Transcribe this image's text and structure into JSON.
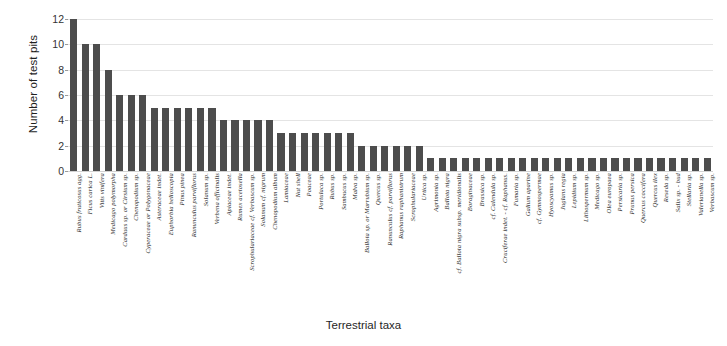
{
  "chart_data": {
    "type": "bar",
    "title": "",
    "xlabel": "Terrestrial taxa",
    "ylabel": "Number of test pits",
    "ylim": [
      0,
      12
    ],
    "yticks": [
      0,
      2,
      4,
      6,
      8,
      10,
      12
    ],
    "grid": true,
    "legend": null,
    "bar_color": "#4d4d4d",
    "orientation": "vertical",
    "categories": [
      "Rubus fruticosus agg.",
      "Ficus carica L.",
      "Vitis vinifera",
      "Medicago polymorpha",
      "Carduus sp. or Cirsium sp.",
      "Chenopodium sp.",
      "Cyperaceae or Polygonaceae",
      "Asteraceae indet.",
      "Euphorbia helioscopia",
      "Pinus pinea",
      "Ranunculus parviflorus",
      "Solanum sp.",
      "Verbena officinalis",
      "Apiaceae indet.",
      "Rumex acetosella",
      "Scrophulariaceae cf. Verbascum sp.",
      "Solanum cf. nigrum",
      "Chenopodium album",
      "Lamiaceae",
      "Nut shell",
      "Poaceae",
      "Portulaca sp.",
      "Rubus sp.",
      "Sambucus sp.",
      "Malva sp.",
      "Ballota sp. or Marrubium sp.",
      "Quercus sp.",
      "Ranunculus cf. parviflorus",
      "Raphanus raphanistrum",
      "Scrophulariaceae",
      "Urtica sp.",
      "Agrimonia sp.",
      "Ballota nigra",
      "cf. Ballota nigra subsp. meridionalis",
      "Boraginaceae",
      "Brassica sp.",
      "cf. Calendula sp.",
      "Cruciferae indet. - cf. Raphanus.",
      "Fumaria sp.",
      "Galium aparine",
      "cf. Gymnospermae",
      "Hyoscyamus sp.",
      "Juglans regia",
      "Lepidium sp.",
      "Lithospermum sp.",
      "Medicago sp.",
      "Olea europaea",
      "Persicaria sp.",
      "Prunus persica",
      "Quercus coccifera",
      "Quercus ilex",
      "Reseda sp.",
      "Salix sp. - bud",
      "Stellaria sp.",
      "Valerianella sp.",
      "Verbascum sp."
    ],
    "values": [
      12,
      10,
      10,
      8,
      6,
      6,
      6,
      5,
      5,
      5,
      5,
      5,
      5,
      4,
      4,
      4,
      4,
      4,
      3,
      3,
      3,
      3,
      3,
      3,
      3,
      2,
      2,
      2,
      2,
      2,
      2,
      1,
      1,
      1,
      1,
      1,
      1,
      1,
      1,
      1,
      1,
      1,
      1,
      1,
      1,
      1,
      1,
      1,
      1,
      1,
      1,
      1,
      1,
      1,
      1,
      1
    ]
  }
}
